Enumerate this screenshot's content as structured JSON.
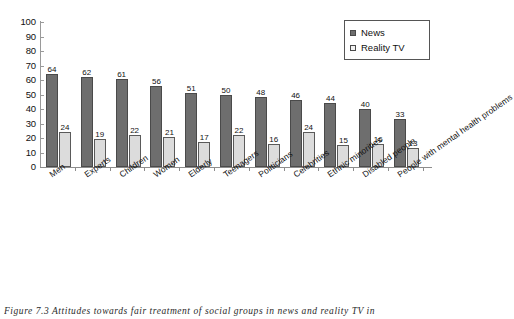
{
  "chart_data": {
    "type": "bar",
    "title": "",
    "xlabel": "",
    "ylabel": "",
    "ylim": [
      0,
      100
    ],
    "yticks": [
      100,
      90,
      80,
      70,
      60,
      50,
      40,
      30,
      20,
      10,
      0
    ],
    "grid": false,
    "legend_position": "top-right",
    "categories": [
      "Men",
      "Experts",
      "Children",
      "Women",
      "Elderly",
      "Teenagers",
      "Politicians",
      "Celebrities",
      "Ethnic minorities",
      "Disabled people",
      "People with mental health problems"
    ],
    "series": [
      {
        "name": "News",
        "color": "#6e6e6e",
        "values": [
          64,
          62,
          61,
          56,
          51,
          50,
          48,
          46,
          44,
          40,
          33
        ]
      },
      {
        "name": "Reality TV",
        "color": "#dcdcdc",
        "values": [
          24,
          19,
          22,
          21,
          17,
          22,
          16,
          24,
          15,
          16,
          13
        ]
      }
    ]
  },
  "legend": {
    "items": [
      {
        "label": "News"
      },
      {
        "label": "Reality TV"
      }
    ]
  },
  "caption": {
    "text": "Figure 7.3 Attitudes towards fair treatment of social groups in news and reality TV in"
  }
}
